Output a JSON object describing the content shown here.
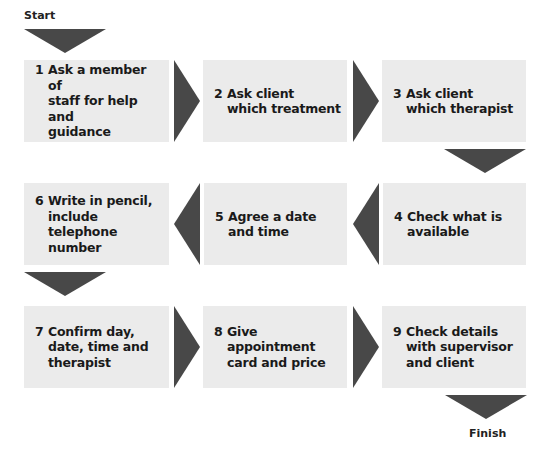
{
  "start_label": "Start",
  "finish_label": "Finish",
  "colors": {
    "box": "#ebebeb",
    "arrow": "#484848",
    "text": "#1a1a1a"
  },
  "steps": [
    {
      "num": "1",
      "text": "Ask a member of\nstaff for help and\nguidance"
    },
    {
      "num": "2",
      "text": "Ask client\nwhich treatment"
    },
    {
      "num": "3",
      "text": "Ask client\nwhich therapist"
    },
    {
      "num": "4",
      "text": "Check what is\navailable"
    },
    {
      "num": "5",
      "text": "Agree a date\nand time"
    },
    {
      "num": "6",
      "text": "Write in pencil,\ninclude telephone\nnumber"
    },
    {
      "num": "7",
      "text": "Confirm day,\ndate, time and\ntherapist"
    },
    {
      "num": "8",
      "text": "Give appointment\ncard and price"
    },
    {
      "num": "9",
      "text": "Check details\nwith supervisor\nand client"
    }
  ]
}
